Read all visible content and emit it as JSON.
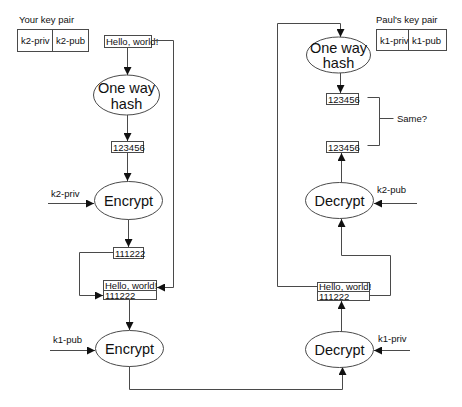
{
  "diagram": {
    "colors": {
      "line": "#4a4a4a",
      "text": "#111111",
      "background": "#ffffff"
    },
    "sender": {
      "key_pair": {
        "title": "Your key pair",
        "private": "k2-priv",
        "public": "k2-pub"
      },
      "message": "Hello, world!",
      "hash_node": {
        "line1": "One way",
        "line2": "hash"
      },
      "hash_value": "123456",
      "sign_node": {
        "label": "Encrypt",
        "key": "k2-priv"
      },
      "signature": "111222",
      "bundle": {
        "line1": "Hello, world!",
        "line2": "111222"
      },
      "encrypt_node": {
        "label": "Encrypt",
        "key": "k1-pub"
      }
    },
    "receiver": {
      "key_pair": {
        "title": "Paul's key pair",
        "private": "k1-priv",
        "public": "k1-pub"
      },
      "decrypt_node": {
        "label": "Decrypt",
        "key": "k1-priv"
      },
      "bundle": {
        "line1": "Hello, world!",
        "line2": "111222"
      },
      "verify_node": {
        "label": "Decrypt",
        "key": "k2-pub"
      },
      "hash_node": {
        "line1": "One way",
        "line2": "hash"
      },
      "hash_value_computed": "123456",
      "hash_value_decrypted": "123456",
      "compare_label": "Same?"
    }
  }
}
